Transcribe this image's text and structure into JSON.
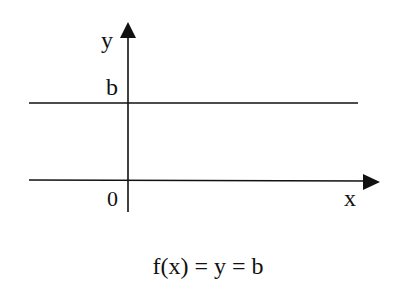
{
  "diagram": {
    "type": "constant-function-graph",
    "axes": {
      "x_label": "x",
      "y_label": "y",
      "origin_label": "0"
    },
    "line": {
      "label": "b",
      "description": "horizontal line y = b"
    },
    "formula": "f(x) = y = b",
    "colors": {
      "stroke": "#111111",
      "background": "#ffffff"
    }
  }
}
